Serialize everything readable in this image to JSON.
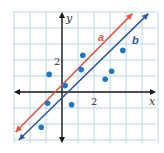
{
  "chart_data": {
    "type": "scatter",
    "title": "",
    "xlabel": "x",
    "ylabel": "y",
    "xlim": [
      -3,
      5.9
    ],
    "ylim": [
      -3.2,
      5
    ],
    "grid": true,
    "tick_labels": {
      "x": [
        "2"
      ],
      "y": [
        "2"
      ]
    },
    "colors": {
      "grid": "#b9d5ea",
      "axis": "#1a1a1a",
      "points": "#1f77c4",
      "line_a": "#e5533f",
      "line_b": "#2e5897"
    },
    "points": [
      {
        "x": 1.3,
        "y": 2.3
      },
      {
        "x": 1.2,
        "y": 1.4
      },
      {
        "x": -0.8,
        "y": 1.1
      },
      {
        "x": 0.2,
        "y": 0.4
      },
      {
        "x": -0.9,
        "y": -0.7
      },
      {
        "x": 0.6,
        "y": -0.8
      },
      {
        "x": -1.3,
        "y": -2.2
      },
      {
        "x": 2.7,
        "y": 0.8
      },
      {
        "x": 3.1,
        "y": 1.3
      },
      {
        "x": 3.8,
        "y": 2.6
      }
    ],
    "series": [
      {
        "name": "a",
        "type": "line",
        "x": [
          -2.9,
          4.4
        ],
        "y": [
          -2.5,
          4.9
        ]
      },
      {
        "name": "b",
        "type": "line",
        "x": [
          -2.7,
          5.4
        ],
        "y": [
          -3.0,
          4.9
        ]
      }
    ]
  }
}
